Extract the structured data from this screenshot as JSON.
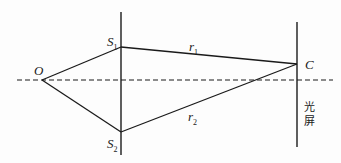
{
  "diagram": {
    "type": "double-slit interference geometry",
    "labels": {
      "source": "O",
      "slit1": {
        "base": "S",
        "sub": "1"
      },
      "slit2": {
        "base": "S",
        "sub": "2"
      },
      "point": "C",
      "path1": {
        "base": "r",
        "sub": "1"
      },
      "path2": {
        "base": "r",
        "sub": "2"
      },
      "screen_line1": "光",
      "screen_line2": "屏"
    },
    "points": {
      "O": [
        42,
        80
      ],
      "S1": [
        121,
        47
      ],
      "S2": [
        121,
        132
      ],
      "C": [
        297,
        64
      ]
    },
    "line_color": "#1a1a1a"
  }
}
